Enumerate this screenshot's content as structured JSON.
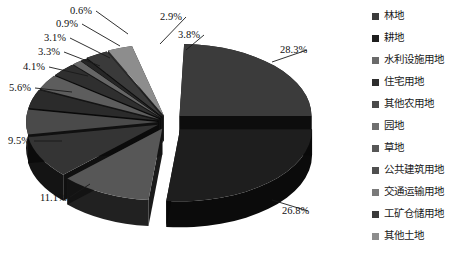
{
  "chart_data": {
    "type": "pie",
    "title": "",
    "subtitle": "",
    "xlabel": "",
    "ylabel": "",
    "legend_position": "right",
    "exploded": true,
    "three_d": true,
    "units": "%",
    "categories": [
      "林地",
      "耕地",
      "水利设施用地",
      "住宅用地",
      "其他农用地",
      "园地",
      "草地",
      "公共建筑用地",
      "交通运输用地",
      "工矿仓储用地",
      "其他土地"
    ],
    "values": [
      28.3,
      26.8,
      11.1,
      9.5,
      5.6,
      4.1,
      3.3,
      3.1,
      0.9,
      0.6,
      2.9
    ],
    "data_labels": [
      "28.3%",
      "26.8%",
      "11.1%",
      "9.5%",
      "5.6%",
      "4.1%",
      "3.3%",
      "3.1%",
      "0.9%",
      "0.6%",
      "2.9%",
      "3.8%"
    ],
    "slice_colors": [
      "#3b3b3b",
      "#1e1e1e",
      "#575757",
      "#343434",
      "#4a4a4a",
      "#2b2b2b",
      "#5d5d5d",
      "#2f2f2f",
      "#666666",
      "#262626",
      "#8d8d8d"
    ]
  },
  "legend": {
    "items": [
      {
        "label": "林地",
        "color": "#3b3b3b"
      },
      {
        "label": "耕地",
        "color": "#1e1e1e"
      },
      {
        "label": "水利设施用地",
        "color": "#6a6a6a"
      },
      {
        "label": "住宅用地",
        "color": "#2e2e2e"
      },
      {
        "label": "其他农用地",
        "color": "#4a4a4a"
      },
      {
        "label": "园地",
        "color": "#6f6f6f"
      },
      {
        "label": "草地",
        "color": "#575757"
      },
      {
        "label": "公共建筑用地",
        "color": "#4f4f4f"
      },
      {
        "label": "交通运输用地",
        "color": "#7a7a7a"
      },
      {
        "label": "工矿仓储用地",
        "color": "#3a3a3a"
      },
      {
        "label": "其他土地",
        "color": "#8d8d8d"
      }
    ]
  },
  "callouts": [
    {
      "text": "0.6%",
      "x": 70,
      "y": 6
    },
    {
      "text": "2.9%",
      "x": 160,
      "y": 12
    },
    {
      "text": "0.9%",
      "x": 56,
      "y": 19
    },
    {
      "text": "3.8%",
      "x": 178,
      "y": 30
    },
    {
      "text": "3.1%",
      "x": 44,
      "y": 33
    },
    {
      "text": "3.3%",
      "x": 38,
      "y": 47
    },
    {
      "text": "4.1%",
      "x": 23,
      "y": 62
    },
    {
      "text": "5.6%",
      "x": 9,
      "y": 83
    },
    {
      "text": "28.3%",
      "x": 280,
      "y": 45
    },
    {
      "text": "9.5%",
      "x": 8,
      "y": 136
    },
    {
      "text": "11.1%",
      "x": 40,
      "y": 193
    },
    {
      "text": "26.8%",
      "x": 282,
      "y": 206
    }
  ],
  "colors": {
    "background": "#ffffff",
    "text": "#111111",
    "leader_line": "#1a1a1a"
  }
}
